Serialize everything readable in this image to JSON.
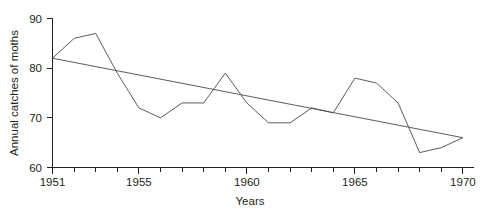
{
  "chart_data": {
    "type": "line",
    "title": "",
    "xlabel": "Years",
    "ylabel": "Annual catches of moths",
    "xlim": [
      1951,
      1970
    ],
    "ylim": [
      60,
      90
    ],
    "grid": false,
    "legend": "none",
    "x": [
      1951,
      1952,
      1953,
      1954,
      1955,
      1956,
      1957,
      1958,
      1959,
      1960,
      1961,
      1962,
      1963,
      1964,
      1965,
      1966,
      1967,
      1968,
      1969,
      1970
    ],
    "series": [
      {
        "name": "Annual catches of moths",
        "values": [
          82,
          86,
          87,
          79,
          72,
          70,
          73,
          73,
          79,
          73,
          69,
          69,
          72,
          71,
          78,
          77,
          73,
          63,
          64,
          66
        ]
      },
      {
        "name": "Linear trend",
        "type": "line",
        "endpoints": [
          {
            "x": 1951,
            "y": 82
          },
          {
            "x": 1970,
            "y": 66
          }
        ]
      }
    ],
    "yticks": [
      60,
      70,
      80,
      90
    ],
    "ytick_labels": [
      "60",
      "70",
      "80",
      "90"
    ],
    "xticks": [
      1951,
      1952,
      1953,
      1954,
      1955,
      1956,
      1957,
      1958,
      1959,
      1960,
      1961,
      1962,
      1963,
      1964,
      1965,
      1966,
      1967,
      1968,
      1969,
      1970
    ],
    "xtick_labels_shown": [
      "1951",
      "1955",
      "1960",
      "1965",
      "1970"
    ]
  },
  "axes": {
    "y_title": "Annual catches of moths",
    "x_title": "Years",
    "y_labels": {
      "t90": "90",
      "t80": "80",
      "t70": "70",
      "t60": "60"
    },
    "x_labels": {
      "l1951": "1951",
      "l1955": "1955",
      "l1960": "1960",
      "l1965": "1965",
      "l1970": "1970"
    }
  }
}
